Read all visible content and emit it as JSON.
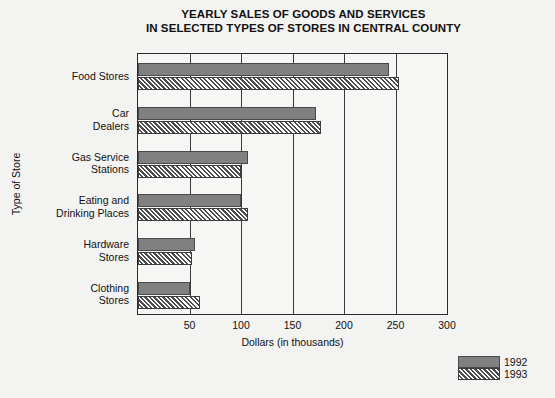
{
  "chart_data": {
    "type": "bar",
    "orientation": "horizontal",
    "title": "YEARLY SALES OF GOODS AND SERVICES IN SELECTED TYPES OF STORES IN CENTRAL COUNTY",
    "title_line1": "YEARLY SALES OF GOODS AND SERVICES",
    "title_line2": "IN SELECTED TYPES OF STORES IN CENTRAL COUNTY",
    "xlabel": "Dollars (in thousands)",
    "ylabel": "Type of Store",
    "xlim": [
      0,
      300
    ],
    "xticks": [
      50,
      100,
      150,
      200,
      250,
      300
    ],
    "xtick_labels": [
      "50",
      "100",
      "150",
      "200",
      "250",
      "300"
    ],
    "grid": true,
    "legend_position": "bottom-right",
    "categories": [
      "Food Stores",
      "Car Dealers",
      "Gas Service Stations",
      "Eating and Drinking Places",
      "Hardware Stores",
      "Clothing Stores"
    ],
    "category_labels": [
      "Food Stores",
      "Car\nDealers",
      "Gas Service\nStations",
      "Eating and\nDrinking Places",
      "Hardware\nStores",
      "Clothing\nStores"
    ],
    "series": [
      {
        "name": "1992",
        "color": "#808080",
        "pattern": "solid",
        "values": [
          244,
          173,
          107,
          100,
          55,
          50
        ]
      },
      {
        "name": "1993",
        "color": "#ffffff",
        "pattern": "diagonal-hatch",
        "values": [
          253,
          178,
          100,
          107,
          52,
          60
        ]
      }
    ]
  },
  "legend": {
    "entries": [
      {
        "label": "1992",
        "swatch": "solid-gray-swatch"
      },
      {
        "label": "1993",
        "swatch": "hatched-swatch"
      }
    ]
  }
}
